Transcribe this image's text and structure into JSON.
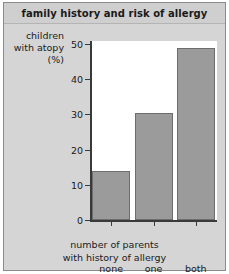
{
  "chart_data": {
    "type": "bar",
    "title": "family history and risk of allergy",
    "categories": [
      "none",
      "one",
      "both"
    ],
    "values": [
      14,
      30.5,
      49
    ],
    "xlabel": "number of parents with history of allergy",
    "xlabel_lines": [
      "number of parents",
      "with history of allergy"
    ],
    "ylabel": "children with atopy (%)",
    "ylabel_lines": [
      "children",
      "with atopy",
      "(%)"
    ],
    "ylim": [
      0,
      50
    ],
    "yticks": [
      0,
      10,
      20,
      30,
      40,
      50
    ],
    "ytick_labels": [
      "0",
      "10",
      "20",
      "30",
      "40",
      "50"
    ],
    "grid": false,
    "legend": null,
    "bar_color": "#9b9b9b",
    "bar_edge_color": "#6d6d6d",
    "axis_color": "#3a3a3a",
    "title_band_color": "#cfcfcf",
    "panel_color": "#d5d5d5",
    "plot_bg_color": "#ffffff"
  }
}
